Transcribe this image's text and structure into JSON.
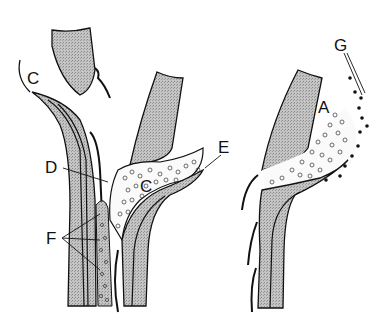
{
  "figure": {
    "labels": {
      "A": "A",
      "C_top": "C",
      "C_mid": "C",
      "D": "D",
      "E": "E",
      "F": "F",
      "G": "G"
    },
    "colors": {
      "stipple": "#b9b9b9",
      "line": "#111111",
      "background": "#ffffff"
    }
  }
}
